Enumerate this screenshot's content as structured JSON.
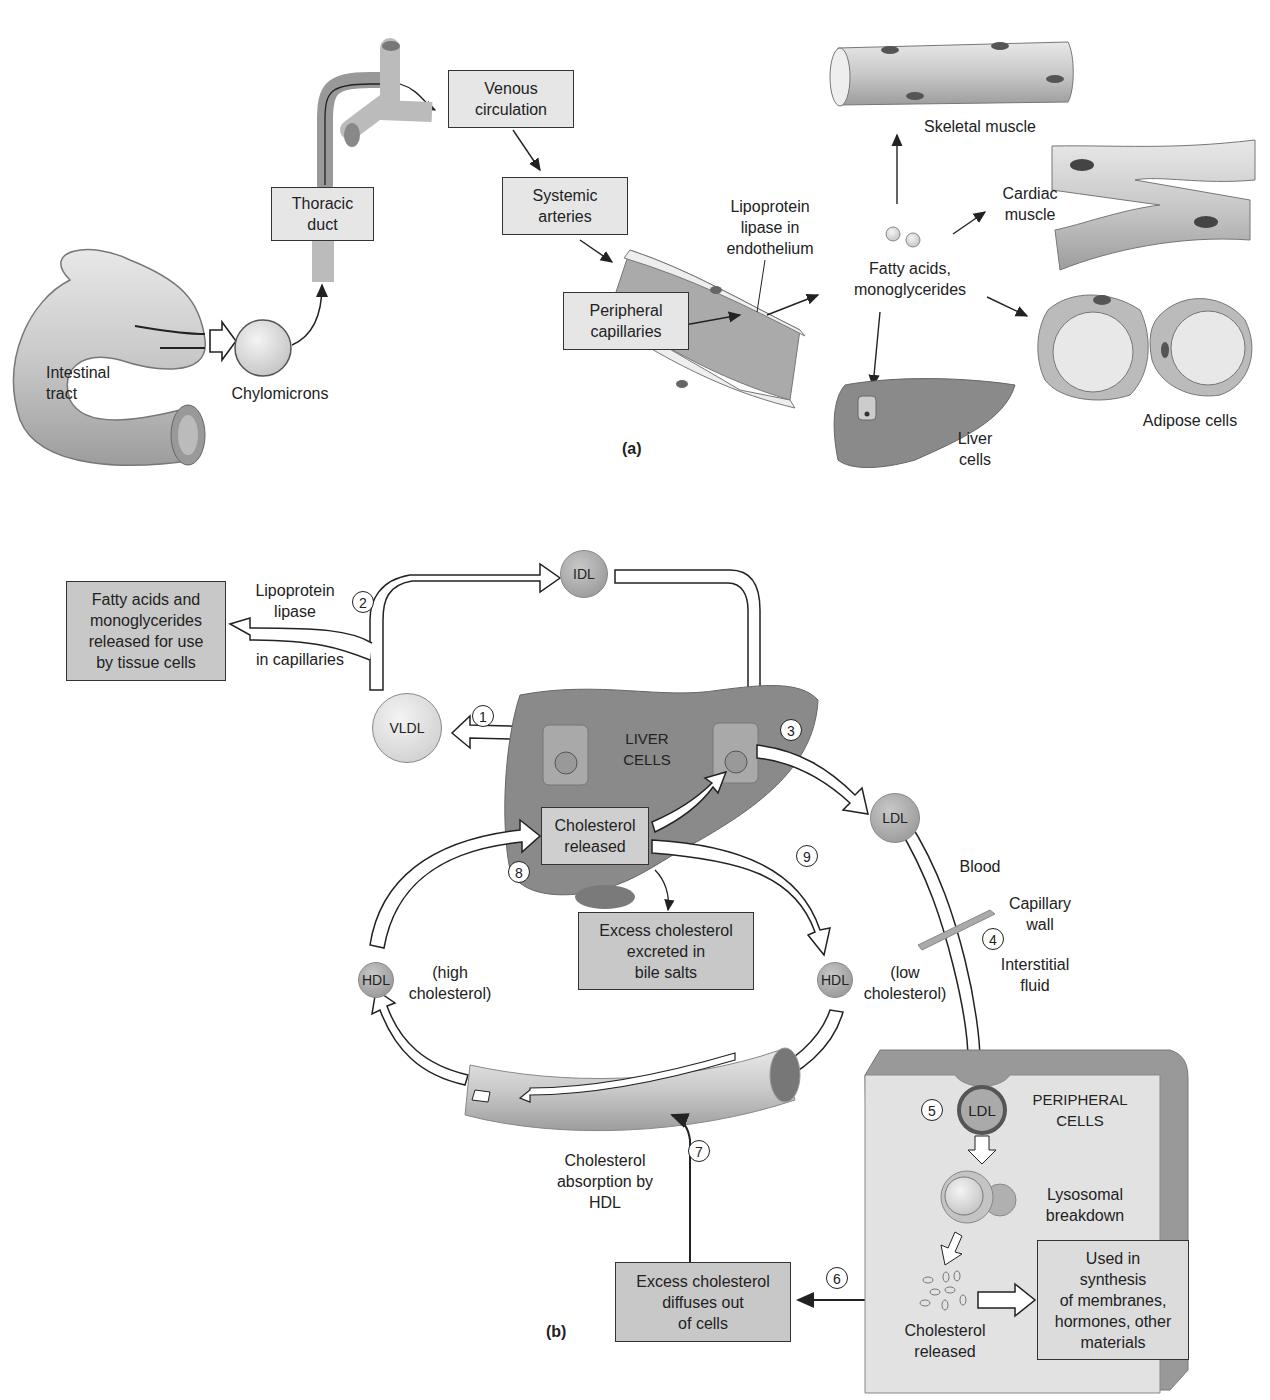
{
  "figure": {
    "panel_a": {
      "label": "(a)",
      "organs": {
        "intestinal_tract": "Intestinal\ntract",
        "chylomicrons": "Chylomicrons",
        "thoracic_duct": "Thoracic\nduct",
        "venous_circulation": "Venous\ncirculation",
        "systemic_arteries": "Systemic\narteries",
        "peripheral_capillaries": "Peripheral\ncapillaries",
        "lipoprotein_lipase": "Lipoprotein\nlipase in\nendothelium",
        "fatty_acids": "Fatty acids,\nmonoglycerides",
        "skeletal_muscle": "Skeletal muscle",
        "cardiac_muscle": "Cardiac\nmuscle",
        "adipose_cells": "Adipose cells",
        "liver_cells": "Liver\ncells"
      }
    },
    "panel_b": {
      "label": "(b)",
      "boxes": {
        "fatty_acids_released": "Fatty acids and\nmonoglycerides\nreleased for use\nby tissue cells",
        "cholesterol_released_liver": "Cholesterol\nreleased",
        "excess_excreted": "Excess cholesterol\nexcreted in\nbile salts",
        "excess_diffuses": "Excess cholesterol\ndiffuses out\nof cells",
        "used_in_synthesis": "Used in\nsynthesis\nof membranes,\nhormones, other\nmaterials"
      },
      "particles": {
        "idl": "IDL",
        "vldl": "VLDL",
        "ldl_blood": "LDL",
        "ldl_cell": "LDL",
        "hdl_high": "HDL",
        "hdl_low": "HDL"
      },
      "labels": {
        "lipoprotein_lipase": "Lipoprotein\nlipase",
        "in_capillaries": "in capillaries",
        "liver_cells": "LIVER\nCELLS",
        "blood": "Blood",
        "capillary_wall": "Capillary\nwall",
        "interstitial_fluid": "Interstitial\nfluid",
        "high_cholesterol": "(high\ncholesterol)",
        "low_cholesterol": "(low\ncholesterol)",
        "peripheral_cells": "PERIPHERAL\nCELLS",
        "lysosomal_breakdown": "Lysosomal\nbreakdown",
        "cholesterol_released_cell": "Cholesterol\nreleased",
        "cholesterol_absorption": "Cholesterol\nabsorption by\nHDL"
      },
      "steps": [
        "1",
        "2",
        "3",
        "4",
        "5",
        "6",
        "7",
        "8",
        "9"
      ]
    }
  },
  "colors": {
    "box_light": "#e6e6e6",
    "box_dark": "#c8c8c8",
    "liver": "#8a8a8a",
    "tissue": "#b5b5b5",
    "line": "#222222"
  }
}
